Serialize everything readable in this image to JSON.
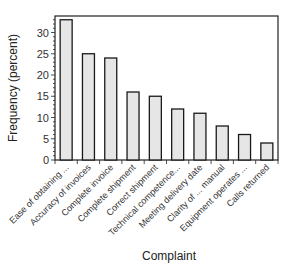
{
  "chart_data": {
    "type": "bar",
    "title": "",
    "xlabel": "Complaint",
    "ylabel": "Frequency (percent)",
    "categories": [
      "Ease of obtaining ...",
      "Accuracy of invoices",
      "Complete invoice",
      "Complete shipment",
      "Correct shipment",
      "Technical competence...",
      "Meeting delivery date",
      "Clarity of ... manual",
      "Equipment operates ...",
      "Calls returned"
    ],
    "values": [
      33,
      25,
      24,
      16,
      15,
      12,
      11,
      8,
      6,
      4
    ],
    "ylim": [
      0,
      35
    ],
    "yticks": [
      0,
      5,
      10,
      15,
      20,
      25,
      30
    ],
    "grid": false,
    "legend": null,
    "colors": {
      "bar_fill": "#e6e6e6",
      "bar_stroke": "#1a1a1a",
      "axis": "#222222"
    }
  }
}
